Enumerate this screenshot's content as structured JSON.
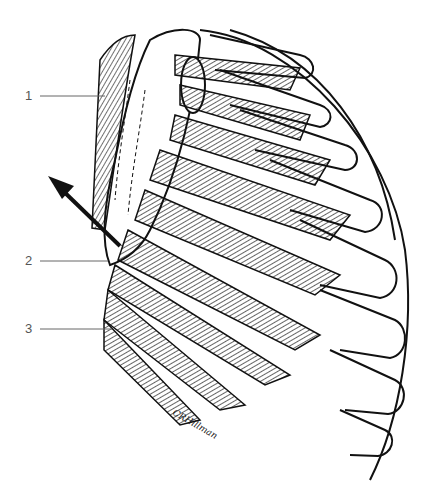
{
  "figure": {
    "labels": [
      {
        "id": "3",
        "text": "3",
        "x": 30,
        "y": 90,
        "line_to": [
          105,
          96
        ]
      },
      {
        "id": "2",
        "text": "2",
        "x": 27,
        "y": 255,
        "line_to": [
          108,
          261
        ]
      },
      {
        "id": "1",
        "text": "1",
        "x": 27,
        "y": 323,
        "line_to": [
          112,
          330
        ]
      }
    ],
    "arrow": {
      "from": [
        118,
        245
      ],
      "to": [
        48,
        178
      ],
      "meaning": "direction of scapular pull"
    },
    "signature": "CRHillman",
    "colors": {
      "ink": "#111111",
      "label": "#555555",
      "leader": "#666666",
      "background": "#ffffff"
    }
  }
}
